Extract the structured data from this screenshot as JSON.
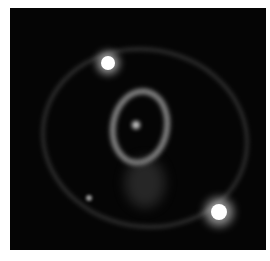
{
  "image": {
    "subject": "supernova triple-ring nebula",
    "background_color": "#050505",
    "border_color": "#ffffff"
  }
}
